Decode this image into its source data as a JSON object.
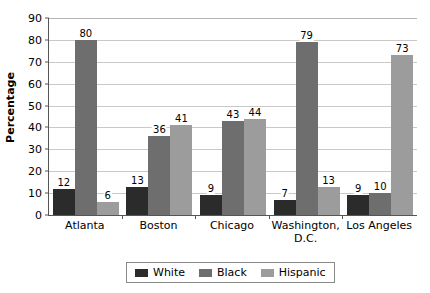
{
  "chart_data": {
    "type": "bar",
    "title": "",
    "xlabel": "",
    "ylabel": "Percentage",
    "ylim": [
      0,
      90
    ],
    "ytick_step": 10,
    "yticks": [
      90,
      80,
      70,
      60,
      50,
      40,
      30,
      20,
      10,
      0
    ],
    "grid": true,
    "legend_position": "bottom",
    "categories": [
      "Atlanta",
      "Boston",
      "Chicago",
      "Washington, D.C.",
      "Los Angeles"
    ],
    "series": [
      {
        "name": "White",
        "color": "#2b2b2b",
        "values": [
          12,
          13,
          9,
          7,
          9
        ]
      },
      {
        "name": "Black",
        "color": "#6e6e6e",
        "values": [
          80,
          36,
          43,
          79,
          10
        ]
      },
      {
        "name": "Hispanic",
        "color": "#9c9c9c",
        "values": [
          6,
          41,
          44,
          13,
          73
        ]
      }
    ]
  },
  "axis": {
    "y_title": "Percentage",
    "y_tick_labels": [
      "90",
      "80",
      "70",
      "60",
      "50",
      "40",
      "30",
      "20",
      "10",
      "0"
    ],
    "x_tick_labels": [
      {
        "line1": "Atlanta",
        "line2": ""
      },
      {
        "line1": "Boston",
        "line2": ""
      },
      {
        "line1": "Chicago",
        "line2": ""
      },
      {
        "line1": "Washington,",
        "line2": "D.C."
      },
      {
        "line1": "Los Angeles",
        "line2": ""
      }
    ]
  },
  "legend": {
    "items": [
      {
        "label": "White",
        "color": "#2b2b2b"
      },
      {
        "label": "Black",
        "color": "#6e6e6e"
      },
      {
        "label": "Hispanic",
        "color": "#9c9c9c"
      }
    ]
  },
  "bar_value_labels": {
    "atlanta": [
      "12",
      "80",
      "6"
    ],
    "boston": [
      "13",
      "36",
      "41"
    ],
    "chicago": [
      "9",
      "43",
      "44"
    ],
    "washington": [
      "7",
      "79",
      "13"
    ],
    "los_angeles": [
      "9",
      "10",
      "73"
    ]
  }
}
